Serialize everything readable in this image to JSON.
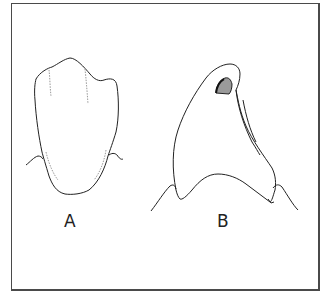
{
  "figure": {
    "type": "line-drawing",
    "panels": [
      {
        "id": "A",
        "label": "A",
        "description": "tooth outline, flat front view with gum line"
      },
      {
        "id": "B",
        "label": "B",
        "description": "tooth outline, profile view with shaded cusp notch and gum line"
      }
    ]
  },
  "colors": {
    "line": "#222222",
    "frame": "#4a4a4a",
    "shading": "#9a9a9a",
    "background": "#ffffff"
  }
}
